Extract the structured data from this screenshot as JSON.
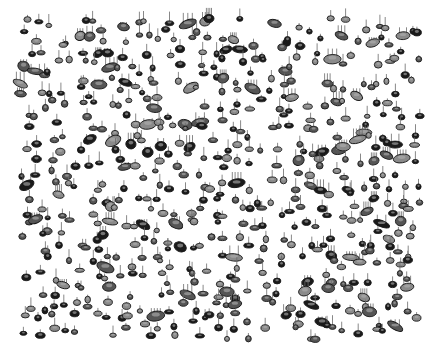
{
  "image": {
    "description": "3D rendered field of protein-spot style peaks (grayscale pins)",
    "width": 443,
    "height": 354,
    "background": "#ffffff",
    "field": {
      "x0": 20,
      "y0": 18,
      "x1": 420,
      "y1": 340
    },
    "colors": {
      "dark": "#1a1a1a",
      "mid": "#555555",
      "light": "#8a8a8a",
      "stem": "#6a6a6a"
    },
    "grid": {
      "cols": 30,
      "rows": 24,
      "seed": 7
    }
  }
}
